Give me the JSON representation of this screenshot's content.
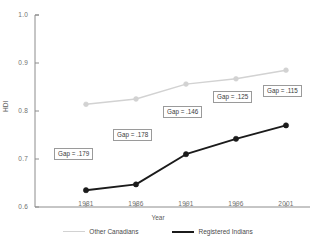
{
  "chart_data": {
    "type": "line",
    "title": "",
    "xlabel": "Year",
    "ylabel": "HDI",
    "x": [
      1981,
      1986,
      1991,
      1996,
      2001
    ],
    "xtick_labels": [
      "1981",
      "1986",
      "1991",
      "1996",
      "2001"
    ],
    "ytick_labels": [
      "0.6",
      "0.7",
      "0.8",
      "0.9",
      "1.0"
    ],
    "ytick_values": [
      0.6,
      0.7,
      0.8,
      0.9,
      1.0
    ],
    "ylim": [
      0.6,
      1.0
    ],
    "xlim": [
      1979,
      2003
    ],
    "grid": false,
    "legend_position": "bottom",
    "series": [
      {
        "name": "Other Canadians",
        "color": "#d2d2d2",
        "marker": "circle",
        "values": [
          0.814,
          0.825,
          0.856,
          0.867,
          0.885
        ]
      },
      {
        "name": "Registered Indians",
        "color": "#1b1b1b",
        "marker": "circle",
        "values": [
          0.635,
          0.647,
          0.71,
          0.742,
          0.77
        ]
      }
    ],
    "annotations": [
      {
        "label": "Gap = .179",
        "x": 1981,
        "value": 0.179
      },
      {
        "label": "Gap = .178",
        "x": 1986,
        "value": 0.178
      },
      {
        "label": "Gap = .146",
        "x": 1991,
        "value": 0.146
      },
      {
        "label": "Gap = .125",
        "x": 1996,
        "value": 0.125
      },
      {
        "label": "Gap = .115",
        "x": 2001,
        "value": 0.115
      }
    ]
  }
}
